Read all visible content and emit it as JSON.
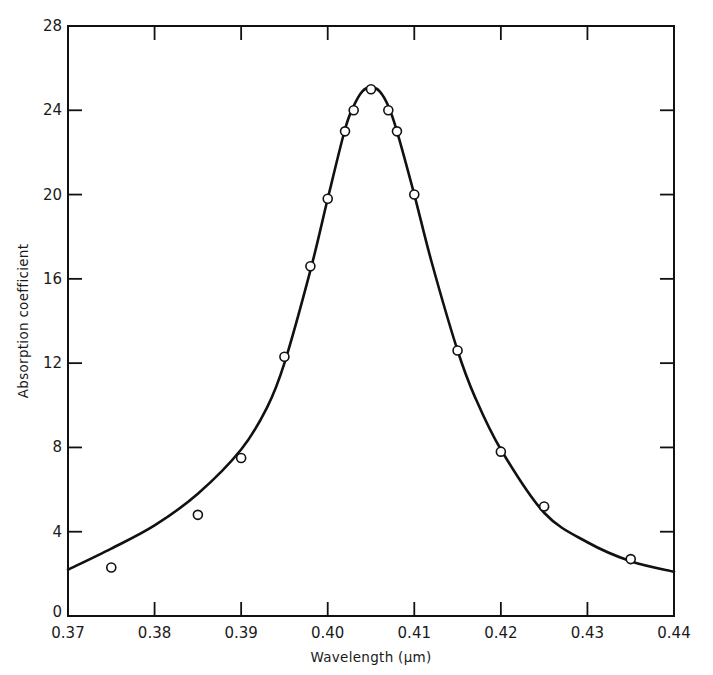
{
  "chart_data": {
    "type": "scatter",
    "title": "",
    "xlabel": "Wavelength (μm)",
    "ylabel": "Absorption coefficient",
    "xlim": [
      0.37,
      0.44
    ],
    "ylim": [
      0,
      28
    ],
    "xticks": [
      0.37,
      0.38,
      0.39,
      0.4,
      0.41,
      0.42,
      0.43,
      0.44
    ],
    "xtick_labels": [
      "0.37",
      "0.38",
      "0.39",
      "0.40",
      "0.41",
      "0.42",
      "0.43",
      "0.44"
    ],
    "yticks": [
      0,
      4,
      8,
      12,
      16,
      20,
      24,
      28
    ],
    "ytick_labels": [
      "0",
      "4",
      "8",
      "12",
      "16",
      "20",
      "24",
      "28"
    ],
    "grid": false,
    "legend": null,
    "series": [
      {
        "name": "measured",
        "marker": "open-circle",
        "x": [
          0.375,
          0.385,
          0.39,
          0.395,
          0.398,
          0.4,
          0.402,
          0.403,
          0.405,
          0.407,
          0.408,
          0.41,
          0.415,
          0.42,
          0.425,
          0.435
        ],
        "y": [
          2.3,
          4.8,
          7.5,
          12.3,
          16.6,
          19.8,
          23.0,
          24.0,
          25.0,
          24.0,
          23.0,
          20.0,
          12.6,
          7.8,
          5.2,
          2.7
        ]
      },
      {
        "name": "fitted curve",
        "style": "solid-line",
        "x": [
          0.37,
          0.375,
          0.38,
          0.385,
          0.39,
          0.393,
          0.395,
          0.398,
          0.4,
          0.402,
          0.403,
          0.404,
          0.405,
          0.406,
          0.407,
          0.408,
          0.41,
          0.412,
          0.415,
          0.417,
          0.42,
          0.425,
          0.43,
          0.435,
          0.44
        ],
        "y": [
          2.2,
          3.2,
          4.3,
          5.8,
          7.9,
          9.9,
          12.0,
          16.4,
          19.8,
          23.1,
          24.2,
          24.9,
          25.1,
          24.9,
          24.2,
          23.0,
          20.0,
          16.8,
          12.6,
          10.4,
          7.9,
          4.9,
          3.5,
          2.6,
          2.1
        ]
      }
    ]
  },
  "plot": {
    "left": 68,
    "right": 674,
    "top": 26,
    "bottom": 616,
    "line_color": "#111111",
    "marker_fill": "#ffffff",
    "marker_radius": 4.5
  }
}
